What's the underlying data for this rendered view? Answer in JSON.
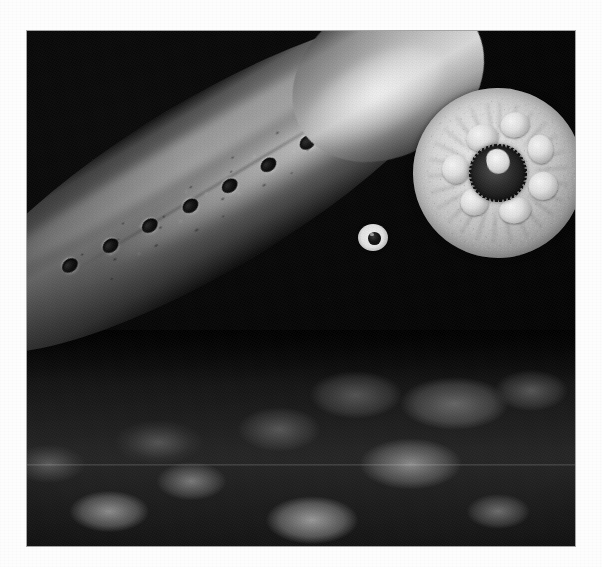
{
  "page": {
    "background_color": "#fdfdfd",
    "width": 602,
    "height": 567
  },
  "photo": {
    "subject": "lamprey",
    "description": "Black-and-white underwater photograph of a lamprey with its circular sucker mouth (oral disc) facing the camera, head raised above a gravel riverbed",
    "treatment": "grayscale",
    "background_color": "#050505",
    "frame": {
      "left": 27,
      "top": 31,
      "width": 548,
      "height": 515
    },
    "alt_text": "Lamprey showing oral disc, eye and seven gill slits"
  },
  "subject_parts": {
    "oral_disc": {
      "name": "oral-disc",
      "center_x_pct": 86,
      "center_y_pct": 27,
      "diameter_pct": 31,
      "rim_texture": "papillate-fringe",
      "cusps": [
        {
          "x_pct": 36,
          "y_pct": 20,
          "w_pct": 19,
          "h_pct": 16
        },
        {
          "x_pct": 57,
          "y_pct": 17,
          "w_pct": 17,
          "h_pct": 15
        },
        {
          "x_pct": 70,
          "y_pct": 33,
          "w_pct": 15,
          "h_pct": 17
        },
        {
          "x_pct": 66,
          "y_pct": 55,
          "w_pct": 17,
          "h_pct": 16
        },
        {
          "x_pct": 46,
          "y_pct": 66,
          "w_pct": 19,
          "h_pct": 15
        },
        {
          "x_pct": 25,
          "y_pct": 56,
          "w_pct": 16,
          "h_pct": 16
        },
        {
          "x_pct": 18,
          "y_pct": 34,
          "w_pct": 16,
          "h_pct": 17
        }
      ]
    },
    "eye": {
      "name": "eye",
      "left_px": 331,
      "top_px": 193,
      "sclera_color": "#e8e8e8",
      "pupil_color": "#0d0d0d"
    },
    "gill_slits": {
      "name": "gill-slits",
      "count": 7,
      "positions": [
        {
          "x_pct": 22.0,
          "y_pct": 48
        },
        {
          "x_pct": 29.5,
          "y_pct": 50
        },
        {
          "x_pct": 37.0,
          "y_pct": 52
        },
        {
          "x_pct": 44.5,
          "y_pct": 54
        },
        {
          "x_pct": 52.0,
          "y_pct": 56
        },
        {
          "x_pct": 59.5,
          "y_pct": 57
        },
        {
          "x_pct": 67.0,
          "y_pct": 58
        }
      ]
    },
    "body": {
      "name": "body",
      "orientation_deg": -31,
      "skin_tone_light": "#b6b6b6",
      "skin_tone_dark": "#2a2a2a",
      "pattern": "mottled-speckled"
    },
    "substrate": {
      "name": "gravel-substrate",
      "description": "rounded pebbles in shadow along the lower portion of the frame",
      "tone": "#2b2b2b"
    }
  },
  "artifacts": {
    "scanline_y_pct": 84,
    "halftone": true,
    "grain": true,
    "vignette": true
  }
}
